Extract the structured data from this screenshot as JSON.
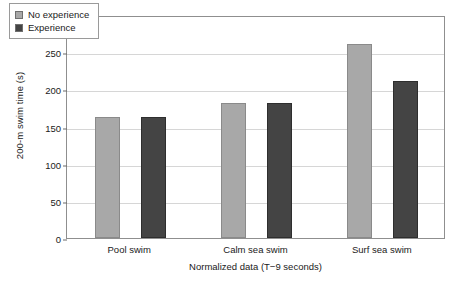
{
  "chart_data": {
    "type": "bar",
    "title": "",
    "xlabel": "Normalized data (T−9 seconds)",
    "ylabel": "200-m swim time (s)",
    "categories": [
      "Pool swim",
      "Calm sea swim",
      "Surf sea swim"
    ],
    "series": [
      {
        "name": "No experience",
        "color": "#a8a8a8",
        "values": [
          163,
          181,
          261
        ]
      },
      {
        "name": "Experience",
        "color": "#444444",
        "values": [
          163,
          181,
          211
        ]
      }
    ],
    "ylim": [
      0,
      300
    ],
    "yticks": [
      0,
      50,
      100,
      150,
      200,
      250,
      300
    ],
    "ytick_labels": [
      "0",
      "50",
      "100",
      "150",
      "200",
      "250",
      "300"
    ],
    "grid": "horizontal",
    "legend_position": "top-left-inside"
  },
  "legend": {
    "items": [
      {
        "label": "No experience",
        "swatch": "light-gray-square-icon"
      },
      {
        "label": "Experience",
        "swatch": "dark-gray-square-icon"
      }
    ]
  }
}
